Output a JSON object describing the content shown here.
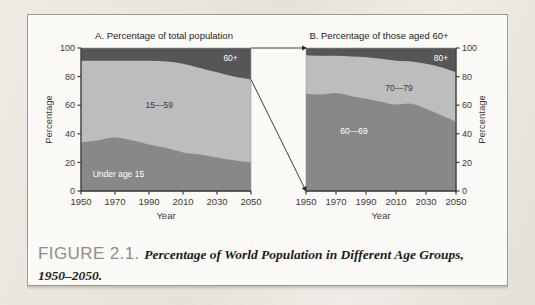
{
  "figure": {
    "label": "FIGURE 2.1.",
    "caption": "Percentage of World Population in Different Age Groups, 1950–2050."
  },
  "colors": {
    "band_dark": "#565656",
    "band_medium": "#888888",
    "band_light": "#bdbdbd",
    "axis": "#3a3a3a",
    "label_light": "#ffffff",
    "label_dark": "#3a3a3a",
    "card_bg": "#fbfaf7",
    "page_bg": "#e9e6df",
    "caption_label": "#8e8e88"
  },
  "chart_data": [
    {
      "id": "panel-a",
      "type": "area",
      "title": "A. Percentage of total population",
      "xlabel": "Year",
      "ylabel": "Percentage",
      "xlim": [
        1950,
        2050
      ],
      "ylim": [
        0,
        100
      ],
      "xticks": [
        1950,
        1970,
        1990,
        2010,
        2030,
        2050
      ],
      "yticks": [
        0,
        20,
        40,
        60,
        80,
        100
      ],
      "yaxis_side": "left",
      "grid": false,
      "legend": "inline-labels",
      "stacked": true,
      "x": [
        1950,
        1960,
        1970,
        1980,
        1990,
        2000,
        2010,
        2020,
        2030,
        2040,
        2050
      ],
      "series": [
        {
          "name": "Under age 15",
          "color": "#888888",
          "label_x": 1972,
          "label_y": 12,
          "label_color": "#ffffff",
          "values": [
            34.0,
            35.5,
            37.5,
            35.5,
            32.5,
            30.0,
            27.0,
            25.5,
            23.5,
            21.5,
            20.0
          ]
        },
        {
          "name": "15—59",
          "color": "#bdbdbd",
          "label_x": 1996,
          "label_y": 60,
          "label_color": "#3a3a3a",
          "values": [
            57.0,
            55.5,
            53.5,
            55.5,
            58.5,
            60.5,
            62.0,
            60.5,
            59.5,
            58.5,
            58.0
          ]
        },
        {
          "name": "60+",
          "color": "#565656",
          "label_x": 2038,
          "label_y": 93,
          "label_color": "#ffffff",
          "values": [
            9.0,
            9.0,
            9.0,
            9.0,
            9.0,
            9.5,
            11.0,
            14.0,
            17.0,
            20.0,
            22.0
          ]
        }
      ],
      "cumulative_top": {
        "under15": [
          34.0,
          35.5,
          37.5,
          35.5,
          32.5,
          30.0,
          27.0,
          25.5,
          23.5,
          21.5,
          20.0
        ],
        "mid": [
          91.0,
          91.0,
          91.0,
          91.0,
          91.0,
          90.5,
          89.0,
          86.0,
          83.0,
          80.0,
          78.0
        ],
        "top": [
          100,
          100,
          100,
          100,
          100,
          100,
          100,
          100,
          100,
          100,
          100
        ]
      }
    },
    {
      "id": "panel-b",
      "type": "area",
      "title": "B. Percentage of those aged 60+",
      "xlabel": "Year",
      "ylabel": "Percentage",
      "xlim": [
        1950,
        2050
      ],
      "ylim": [
        0,
        100
      ],
      "xticks": [
        1950,
        1970,
        1990,
        2010,
        2030,
        2050
      ],
      "yticks": [
        0,
        20,
        40,
        60,
        80,
        100
      ],
      "yaxis_side": "right",
      "grid": false,
      "legend": "inline-labels",
      "stacked": true,
      "x": [
        1950,
        1960,
        1970,
        1980,
        1990,
        2000,
        2010,
        2020,
        2030,
        2040,
        2050
      ],
      "series": [
        {
          "name": "60—69",
          "color": "#888888",
          "label_x": 1982,
          "label_y": 42,
          "label_color": "#ffffff",
          "values": [
            68.0,
            67.5,
            68.5,
            66.5,
            64.5,
            62.5,
            60.5,
            61.0,
            57.5,
            53.0,
            48.5
          ]
        },
        {
          "name": "70—79",
          "color": "#bdbdbd",
          "label_x": 2012,
          "label_y": 72,
          "label_color": "#3a3a3a",
          "values": [
            27.0,
            27.0,
            26.0,
            27.5,
            29.0,
            30.0,
            30.5,
            29.5,
            31.5,
            33.5,
            34.5
          ]
        },
        {
          "name": "80+",
          "color": "#565656",
          "label_x": 2040,
          "label_y": 93,
          "label_color": "#ffffff",
          "values": [
            5.0,
            5.5,
            5.5,
            6.0,
            6.5,
            7.5,
            9.0,
            9.5,
            11.0,
            13.5,
            17.0
          ]
        }
      ],
      "cumulative_top": {
        "low": [
          68.0,
          67.5,
          68.5,
          66.5,
          64.5,
          62.5,
          60.5,
          61.0,
          57.5,
          53.0,
          48.5
        ],
        "mid": [
          95.0,
          94.5,
          94.5,
          94.0,
          93.5,
          92.5,
          91.0,
          90.5,
          89.0,
          86.5,
          83.0
        ],
        "top": [
          100,
          100,
          100,
          100,
          100,
          100,
          100,
          100,
          100,
          100,
          100
        ]
      }
    }
  ],
  "connectors": {
    "description": "arrows linking the 60+ band of panel A to the full extent of panel B",
    "arrows": [
      {
        "name": "connector-top",
        "from_panel": "panel-a",
        "from_year": 2050,
        "from_value": 100,
        "to_panel": "panel-b",
        "to_year": 1950,
        "to_value": 100
      },
      {
        "name": "connector-bottom",
        "from_panel": "panel-a",
        "from_year": 2050,
        "from_value": 78,
        "to_panel": "panel-b",
        "to_year": 1950,
        "to_value": 0
      }
    ]
  }
}
